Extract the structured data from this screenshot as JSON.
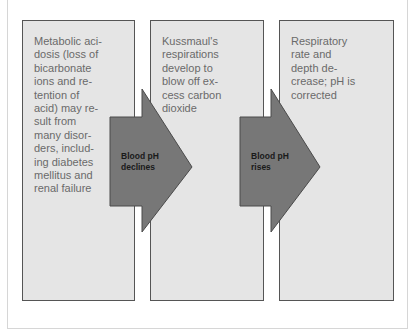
{
  "diagram": {
    "type": "process-flow",
    "steps": [
      {
        "id": "step-1",
        "text": "Metabolic aci-\ndosis (loss of\nbicarbonate\nions and re-\ntention of\nacid) may re-\nsult from\nmany disor-\nders, includ-\ning diabetes\nmellitus and\nrenal failure"
      },
      {
        "id": "step-2",
        "text": "Kussmaul's\nrespirations\ndevelop to\nblow off ex-\ncess carbon\ndioxide"
      },
      {
        "id": "step-3",
        "text": "Respiratory\nrate and\ndepth de-\ncrease; pH is\ncorrected"
      }
    ],
    "arrows": [
      {
        "id": "arrow-1",
        "from": "step-1",
        "to": "step-2",
        "label": "Blood pH\ndeclines"
      },
      {
        "id": "arrow-2",
        "from": "step-2",
        "to": "step-3",
        "label": "Blood pH\nrises"
      }
    ],
    "colors": {
      "box_fill": "#e5e5e5",
      "box_border": "#555555",
      "box_text": "#6a6a6a",
      "arrow_fill": "#777777",
      "arrow_stroke": "#4a4a4a",
      "arrow_text": "#1a1a1a"
    }
  }
}
